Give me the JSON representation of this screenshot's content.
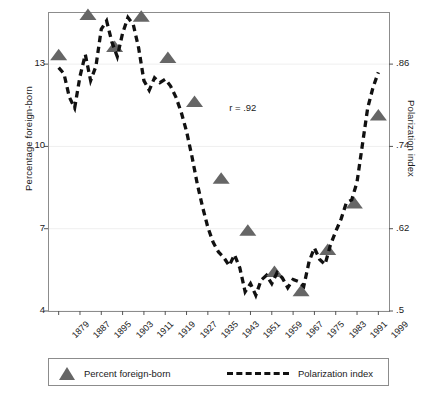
{
  "chart_data": {
    "type": "line",
    "title": "",
    "subtitle": "",
    "xlabel": "",
    "ylabel": "Percentage foreign-born",
    "ylabel_right": "Polarization index",
    "xlim": [
      1875,
      2003
    ],
    "ylim": [
      4,
      14.9
    ],
    "ylim_right": [
      0.5,
      0.936
    ],
    "grid": true,
    "legend_position": "below-axis",
    "xticks": [
      1879,
      1887,
      1895,
      1903,
      1911,
      1919,
      1927,
      1935,
      1943,
      1951,
      1959,
      1967,
      1975,
      1983,
      1991,
      1999
    ],
    "xtick_labels": [
      "1879",
      "1887",
      "1895",
      "1903",
      "1911",
      "1919",
      "1927",
      "1935",
      "1943",
      "1951",
      "1959",
      "1967",
      "1975",
      "1983",
      "1991",
      "1999"
    ],
    "yticks_left": [
      4,
      7,
      10,
      13
    ],
    "ytick_labels_left": [
      "4",
      "7",
      "10",
      "13"
    ],
    "yticks_right": [
      0.5,
      0.62,
      0.74,
      0.86
    ],
    "ytick_labels_right": [
      ".5",
      ".62",
      ".74",
      ".86"
    ],
    "annotations": [
      {
        "text": "r = .92",
        "x": 1949,
        "y": 11.4
      }
    ],
    "series": [
      {
        "name": "Percent foreign-born",
        "type": "scatter",
        "marker": "triangle",
        "color": "#666666",
        "axis": "left",
        "points": [
          {
            "x": 1879,
            "y": 13.3
          },
          {
            "x": 1890,
            "y": 14.77
          },
          {
            "x": 1900,
            "y": 13.6
          },
          {
            "x": 1910,
            "y": 14.7
          },
          {
            "x": 1920,
            "y": 13.2
          },
          {
            "x": 1930,
            "y": 11.6
          },
          {
            "x": 1940,
            "y": 8.8
          },
          {
            "x": 1950,
            "y": 6.9
          },
          {
            "x": 1960,
            "y": 5.4
          },
          {
            "x": 1970,
            "y": 4.7
          },
          {
            "x": 1980,
            "y": 6.2
          },
          {
            "x": 1990,
            "y": 7.9
          },
          {
            "x": 1999,
            "y": 11.1
          }
        ]
      },
      {
        "name": "Polarization index",
        "type": "line",
        "linestyle": "dashed",
        "color": "#111111",
        "axis": "right",
        "points": [
          {
            "x": 1879,
            "y": 0.855
          },
          {
            "x": 1881,
            "y": 0.846
          },
          {
            "x": 1883,
            "y": 0.812
          },
          {
            "x": 1885,
            "y": 0.796
          },
          {
            "x": 1887,
            "y": 0.842
          },
          {
            "x": 1889,
            "y": 0.874
          },
          {
            "x": 1891,
            "y": 0.836
          },
          {
            "x": 1893,
            "y": 0.857
          },
          {
            "x": 1895,
            "y": 0.911
          },
          {
            "x": 1897,
            "y": 0.923
          },
          {
            "x": 1899,
            "y": 0.892
          },
          {
            "x": 1901,
            "y": 0.871
          },
          {
            "x": 1903,
            "y": 0.905
          },
          {
            "x": 1905,
            "y": 0.928
          },
          {
            "x": 1907,
            "y": 0.918
          },
          {
            "x": 1909,
            "y": 0.884
          },
          {
            "x": 1911,
            "y": 0.836
          },
          {
            "x": 1913,
            "y": 0.822
          },
          {
            "x": 1915,
            "y": 0.84
          },
          {
            "x": 1917,
            "y": 0.833
          },
          {
            "x": 1919,
            "y": 0.838
          },
          {
            "x": 1921,
            "y": 0.828
          },
          {
            "x": 1923,
            "y": 0.812
          },
          {
            "x": 1925,
            "y": 0.79
          },
          {
            "x": 1927,
            "y": 0.762
          },
          {
            "x": 1929,
            "y": 0.726
          },
          {
            "x": 1931,
            "y": 0.686
          },
          {
            "x": 1933,
            "y": 0.652
          },
          {
            "x": 1935,
            "y": 0.622
          },
          {
            "x": 1937,
            "y": 0.6
          },
          {
            "x": 1939,
            "y": 0.586
          },
          {
            "x": 1941,
            "y": 0.578
          },
          {
            "x": 1943,
            "y": 0.566
          },
          {
            "x": 1945,
            "y": 0.582
          },
          {
            "x": 1947,
            "y": 0.563
          },
          {
            "x": 1949,
            "y": 0.528
          },
          {
            "x": 1951,
            "y": 0.54
          },
          {
            "x": 1953,
            "y": 0.523
          },
          {
            "x": 1955,
            "y": 0.545
          },
          {
            "x": 1957,
            "y": 0.552
          },
          {
            "x": 1959,
            "y": 0.54
          },
          {
            "x": 1961,
            "y": 0.556
          },
          {
            "x": 1963,
            "y": 0.548
          },
          {
            "x": 1965,
            "y": 0.534
          },
          {
            "x": 1967,
            "y": 0.546
          },
          {
            "x": 1969,
            "y": 0.543
          },
          {
            "x": 1971,
            "y": 0.536
          },
          {
            "x": 1973,
            "y": 0.572
          },
          {
            "x": 1975,
            "y": 0.592
          },
          {
            "x": 1977,
            "y": 0.575
          },
          {
            "x": 1979,
            "y": 0.568
          },
          {
            "x": 1981,
            "y": 0.596
          },
          {
            "x": 1983,
            "y": 0.616
          },
          {
            "x": 1985,
            "y": 0.634
          },
          {
            "x": 1987,
            "y": 0.658
          },
          {
            "x": 1989,
            "y": 0.662
          },
          {
            "x": 1991,
            "y": 0.688
          },
          {
            "x": 1993,
            "y": 0.742
          },
          {
            "x": 1995,
            "y": 0.796
          },
          {
            "x": 1997,
            "y": 0.826
          },
          {
            "x": 1999,
            "y": 0.848
          }
        ]
      }
    ]
  },
  "legend": {
    "items": [
      {
        "label": "Percent foreign-born",
        "marker": "triangle",
        "color": "#666666"
      },
      {
        "label": "Polarization index",
        "marker": "dashed-line",
        "color": "#111111"
      }
    ]
  },
  "style": {
    "frame_color": "#8c8c8c",
    "grid_color": "#efefef",
    "marker_color": "#666666",
    "line_color": "#111111",
    "background": "#ffffff",
    "text_color": "#1a1a1a"
  }
}
